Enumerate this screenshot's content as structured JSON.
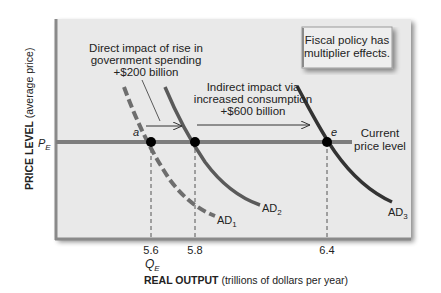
{
  "diagram": {
    "callout": {
      "line1": "Fiscal policy has",
      "line2": "multiplier effects."
    },
    "direct_impact": {
      "line1": "Direct impact of rise in",
      "line2": "government spending",
      "line3": "+$200 billion"
    },
    "indirect_impact": {
      "line1": "Indirect impact via",
      "line2": "increased consumption",
      "line3": "+$600 billion"
    },
    "price_line_label": {
      "line1": "Current",
      "line2": "price level"
    },
    "points": {
      "a": "a",
      "e": "e"
    },
    "curves": {
      "ad1": {
        "base": "AD",
        "sub": "1",
        "style": "dashed"
      },
      "ad2": {
        "base": "AD",
        "sub": "2",
        "style": "solid"
      },
      "ad3": {
        "base": "AD",
        "sub": "3",
        "style": "solid"
      }
    },
    "y_axis": {
      "bold": "PRICE LEVEL",
      "regular": " (average price)",
      "pe_base": "P",
      "pe_sub": "E"
    },
    "x_axis": {
      "bold": "REAL OUTPUT",
      "regular": " (trillions of dollars per year)",
      "ticks": [
        "5.6",
        "5.8",
        "6.4"
      ],
      "qe_base": "Q",
      "qe_sub": "E"
    },
    "colors": {
      "plot_bg": "#e9e9e9",
      "frame": "#8a8a8a",
      "price_line": "#7d7d7d",
      "ad1": "#6e6e6e",
      "ad2": "#5a5a5a",
      "ad3": "#333333",
      "point": "#000000"
    }
  }
}
